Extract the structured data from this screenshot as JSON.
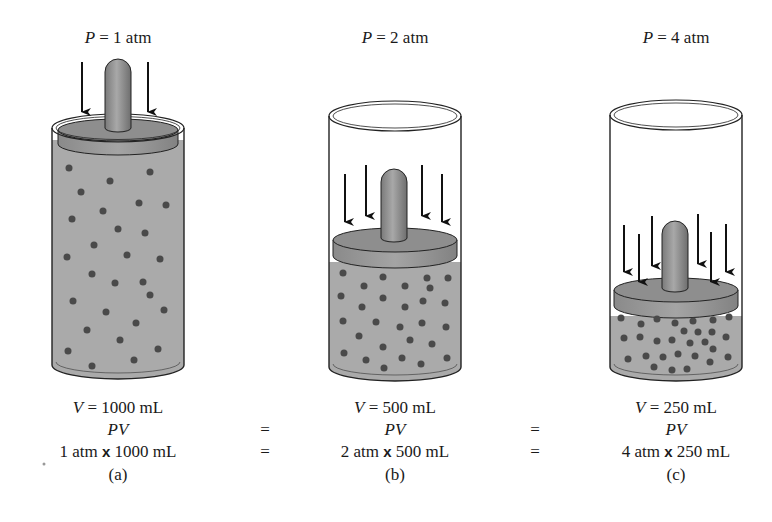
{
  "cylinders": [
    {
      "id": "a",
      "pressure_label": "P = 1 atm",
      "pressure_var": "P",
      "pressure_value": "= 1 atm",
      "volume_label": "V = 1000 mL",
      "volume_var": "V",
      "volume_value": "= 1000 mL",
      "pv_label": "PV",
      "product_label": "1 atm x 1000 mL",
      "product_left": "1 atm",
      "product_times": "x",
      "product_right": "1000 mL",
      "caption": "(a)",
      "arrow_count": 2,
      "particle_count": 28
    },
    {
      "id": "b",
      "pressure_label": "P = 2 atm",
      "pressure_var": "P",
      "pressure_value": "= 2 atm",
      "volume_label": "V = 500 mL",
      "volume_var": "V",
      "volume_value": "= 500 mL",
      "pv_label": "PV",
      "product_label": "2 atm x 500 mL",
      "product_left": "2 atm",
      "product_times": "x",
      "product_right": "500 mL",
      "caption": "(b)",
      "arrow_count": 4,
      "particle_count": 28
    },
    {
      "id": "c",
      "pressure_label": "P = 4 atm",
      "pressure_var": "P",
      "pressure_value": "= 4 atm",
      "volume_label": "V = 250 mL",
      "volume_var": "V",
      "volume_value": "= 250 mL",
      "pv_label": "PV",
      "product_label": "4 atm x 250 mL",
      "product_left": "4 atm",
      "product_times": "x",
      "product_right": "250 mL",
      "caption": "(c)",
      "arrow_count": 7,
      "particle_count": 28
    }
  ],
  "equals_sign": "=",
  "colors": {
    "gas": "#a9a9a9",
    "particle": "#4a4a4a",
    "piston_top": "#8c8c8c",
    "piston_side": "#9a9a9a",
    "outline": "#222222"
  }
}
